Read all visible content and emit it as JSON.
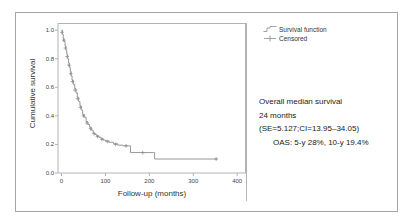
{
  "figure": {
    "legend": [
      {
        "label": "Survival function",
        "marker": "step-line"
      },
      {
        "label": "Censored",
        "marker": "plus-tick"
      }
    ],
    "annotation": {
      "line1": "Overall median survival",
      "line2": "24 months",
      "line3": "(SE=5.127;CI=13.95–34.05)",
      "line4": "OAS: 5-y 28%, 10-y 19.4%"
    }
  },
  "chart_data": {
    "type": "line",
    "title": "",
    "xlabel": "Follow-up (months)",
    "ylabel": "Cumulative survival",
    "xlim": [
      -8,
      420
    ],
    "ylim": [
      0,
      1.05
    ],
    "xticks": [
      0,
      100,
      200,
      300,
      400
    ],
    "xtick_labels": [
      "0",
      "100",
      "200",
      "300",
      "400"
    ],
    "yticks": [
      0.0,
      0.2,
      0.4,
      0.6,
      0.8,
      1.0
    ],
    "ytick_labels": [
      "0.0",
      "0.2",
      "0.4",
      "0.6",
      "0.8",
      "1.0"
    ],
    "grid": false,
    "legend_position": "top-right-outside",
    "curve_color": "#8c8c8c",
    "series": [
      {
        "name": "Survival function",
        "step": "post",
        "points": [
          [
            0,
            1.0
          ],
          [
            2,
            0.97
          ],
          [
            4,
            0.94
          ],
          [
            6,
            0.92
          ],
          [
            8,
            0.89
          ],
          [
            10,
            0.86
          ],
          [
            12,
            0.83
          ],
          [
            14,
            0.8
          ],
          [
            16,
            0.77
          ],
          [
            18,
            0.74
          ],
          [
            20,
            0.71
          ],
          [
            22,
            0.68
          ],
          [
            24,
            0.65
          ],
          [
            27,
            0.62
          ],
          [
            30,
            0.59
          ],
          [
            33,
            0.56
          ],
          [
            36,
            0.53
          ],
          [
            39,
            0.5
          ],
          [
            42,
            0.47
          ],
          [
            45,
            0.44
          ],
          [
            48,
            0.41
          ],
          [
            52,
            0.39
          ],
          [
            56,
            0.36
          ],
          [
            60,
            0.34
          ],
          [
            64,
            0.32
          ],
          [
            68,
            0.3
          ],
          [
            72,
            0.28
          ],
          [
            76,
            0.27
          ],
          [
            80,
            0.26
          ],
          [
            85,
            0.25
          ],
          [
            90,
            0.24
          ],
          [
            95,
            0.23
          ],
          [
            100,
            0.225
          ],
          [
            108,
            0.215
          ],
          [
            118,
            0.205
          ],
          [
            128,
            0.195
          ],
          [
            140,
            0.19
          ],
          [
            155,
            0.19
          ],
          [
            157,
            0.143
          ],
          [
            210,
            0.143
          ],
          [
            212,
            0.098
          ],
          [
            355,
            0.098
          ]
        ]
      },
      {
        "name": "Censored",
        "marker": "plus",
        "points": [
          [
            1,
            0.985
          ],
          [
            5,
            0.93
          ],
          [
            9,
            0.875
          ],
          [
            13,
            0.815
          ],
          [
            17,
            0.755
          ],
          [
            21,
            0.695
          ],
          [
            25,
            0.64
          ],
          [
            31,
            0.58
          ],
          [
            37,
            0.52
          ],
          [
            43,
            0.46
          ],
          [
            50,
            0.4
          ],
          [
            58,
            0.35
          ],
          [
            66,
            0.31
          ],
          [
            74,
            0.275
          ],
          [
            82,
            0.255
          ],
          [
            92,
            0.235
          ],
          [
            104,
            0.22
          ],
          [
            123,
            0.2
          ],
          [
            147,
            0.19
          ],
          [
            185,
            0.143
          ],
          [
            352,
            0.098
          ]
        ]
      }
    ]
  }
}
